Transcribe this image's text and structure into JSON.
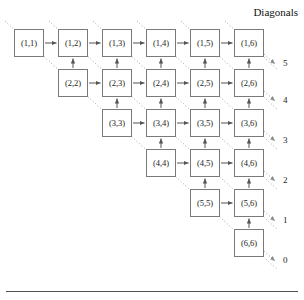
{
  "figure": {
    "title": "Diagonals",
    "bottom_rule": true
  },
  "grid": {
    "rows": 6,
    "cols": 6,
    "origin_x": 14,
    "origin_y": 29,
    "col_step": 44,
    "row_step": 40,
    "box_width": 30,
    "box_height": 28,
    "cells": [
      {
        "label": "(1,1)",
        "row": 1,
        "col": 1
      },
      {
        "label": "(1,2)",
        "row": 1,
        "col": 2
      },
      {
        "label": "(1,3)",
        "row": 1,
        "col": 3
      },
      {
        "label": "(1,4)",
        "row": 1,
        "col": 4
      },
      {
        "label": "(1,5)",
        "row": 1,
        "col": 5
      },
      {
        "label": "(1,6)",
        "row": 1,
        "col": 6
      },
      {
        "label": "(2,2)",
        "row": 2,
        "col": 2
      },
      {
        "label": "(2,3)",
        "row": 2,
        "col": 3
      },
      {
        "label": "(2,4)",
        "row": 2,
        "col": 4
      },
      {
        "label": "(2,5)",
        "row": 2,
        "col": 5
      },
      {
        "label": "(2,6)",
        "row": 2,
        "col": 6
      },
      {
        "label": "(3,3)",
        "row": 3,
        "col": 3
      },
      {
        "label": "(3,4)",
        "row": 3,
        "col": 4
      },
      {
        "label": "(3,5)",
        "row": 3,
        "col": 5
      },
      {
        "label": "(3,6)",
        "row": 3,
        "col": 6
      },
      {
        "label": "(4,4)",
        "row": 4,
        "col": 4
      },
      {
        "label": "(4,5)",
        "row": 4,
        "col": 5
      },
      {
        "label": "(4,6)",
        "row": 4,
        "col": 6
      },
      {
        "label": "(5,5)",
        "row": 5,
        "col": 5
      },
      {
        "label": "(5,6)",
        "row": 5,
        "col": 6
      },
      {
        "label": "(6,6)",
        "row": 6,
        "col": 6
      }
    ]
  },
  "diagonal_labels": [
    {
      "text": "5",
      "x": 283,
      "y": 64
    },
    {
      "text": "4",
      "x": 283,
      "y": 101
    },
    {
      "text": "3",
      "x": 283,
      "y": 141
    },
    {
      "text": "2",
      "x": 283,
      "y": 181
    },
    {
      "text": "1",
      "x": 283,
      "y": 221
    },
    {
      "text": "0",
      "x": 283,
      "y": 261
    }
  ],
  "colors": {
    "box_border": "#7a7a7a",
    "arrow": "#555555",
    "dotted": "#999999",
    "text": "#1a1a1a",
    "rule": "#555555"
  }
}
